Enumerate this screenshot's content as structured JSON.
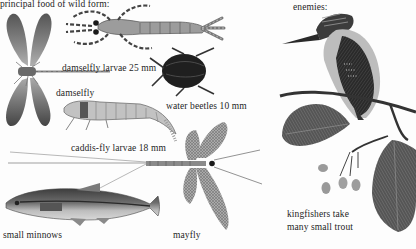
{
  "plate": {
    "heading_left": "principal food of wild form:",
    "heading_right": "enemies:",
    "labels": {
      "damselfly_larvae": "damselfly larvae 25 mm",
      "damselfly": "damselfly",
      "water_beetles": "water beetles 10 mm",
      "caddis_fly_larvae": "caddis-fly larvae 18 mm",
      "small_minnows": "small minnows",
      "mayfly": "mayfly",
      "kingfishers_line1": "kingfishers take",
      "kingfishers_line2": "many small trout"
    },
    "illustrations": [
      {
        "name": "damselfly",
        "icon": "damselfly-illustration"
      },
      {
        "name": "damselfly larvae",
        "icon": "damselfly-larva-illustration"
      },
      {
        "name": "water beetle",
        "icon": "water-beetle-illustration"
      },
      {
        "name": "caddis-fly larvae",
        "icon": "caddis-larva-illustration"
      },
      {
        "name": "mayfly",
        "icon": "mayfly-illustration"
      },
      {
        "name": "small minnow",
        "icon": "minnow-illustration"
      },
      {
        "name": "kingfisher",
        "icon": "kingfisher-illustration"
      },
      {
        "name": "alder branch",
        "icon": "alder-branch-illustration"
      }
    ],
    "colors": {
      "paper": "#fdfdfd",
      "ink": "#1e1e1e",
      "dark_gray": "#3a3a3a",
      "mid_gray": "#777777",
      "light_gray": "#b5b5b5"
    }
  }
}
